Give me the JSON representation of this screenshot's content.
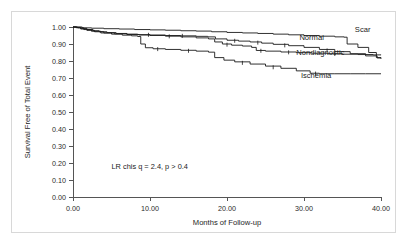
{
  "figure": {
    "background_color": "#ffffff",
    "frame_color": "#d8d8d8",
    "axis_color": "#555555",
    "curve_color": "#1a1a1a"
  },
  "annotation": {
    "statistics": "LR chis q = 2.4, p > 0.4"
  },
  "labels": {
    "scar": "Scar",
    "normal": "Normal",
    "nondiagnostic": "Nondiagnostic",
    "ischemia": "Ischemia"
  },
  "axes": {
    "x_title": "Months of Follow-up",
    "y_title": "Survival Free of Total Event",
    "x_ticks": [
      "0.00",
      "10.00",
      "20.00",
      "30.00",
      "40.00"
    ],
    "y_ticks": [
      "1.00",
      "0.90",
      "0.80",
      "0.70",
      "0.60",
      "0.50",
      "0.40",
      "0.30",
      "0.20",
      "0.10",
      "0.00"
    ]
  },
  "chart_data": {
    "type": "line",
    "title": "",
    "subtitle": "",
    "xlabel": "Months of Follow-up",
    "ylabel": "Survival Free of Total Event",
    "xlim": [
      0,
      40
    ],
    "ylim": [
      0,
      1
    ],
    "xticks": [
      0,
      10,
      20,
      30,
      40
    ],
    "yticks": [
      0.0,
      0.1,
      0.2,
      0.3,
      0.4,
      0.5,
      0.6,
      0.7,
      0.8,
      0.9,
      1.0
    ],
    "xtick_labels": [
      "0.00",
      "10.00",
      "20.00",
      "30.00",
      "40.00"
    ],
    "ytick_labels": [
      "0.00",
      "0.10",
      "0.20",
      "0.30",
      "0.40",
      "0.50",
      "0.60",
      "0.70",
      "0.80",
      "0.90",
      "1.00"
    ],
    "grid": false,
    "legend": "inline-right-labels",
    "annotations": [
      {
        "text": "LR chis q = 2.4, p > 0.4",
        "x": 5.0,
        "y": 0.165
      }
    ],
    "curve_style": "kaplan-meier step",
    "series": [
      {
        "name": "Scar",
        "label_x": 36.6,
        "label_y": 0.972,
        "points": [
          [
            0.0,
            1.0
          ],
          [
            0.6,
            1.0
          ],
          [
            1.2,
            0.995
          ],
          [
            2.4,
            0.993
          ],
          [
            4.0,
            0.99
          ],
          [
            6.0,
            0.988
          ],
          [
            8.0,
            0.985
          ],
          [
            10.0,
            0.983
          ],
          [
            12.0,
            0.981
          ],
          [
            14.0,
            0.978
          ],
          [
            16.0,
            0.976
          ],
          [
            18.0,
            0.972
          ],
          [
            20.0,
            0.968
          ],
          [
            22.0,
            0.965
          ],
          [
            24.0,
            0.962
          ],
          [
            26.0,
            0.958
          ],
          [
            28.0,
            0.954
          ],
          [
            30.0,
            0.95
          ],
          [
            32.0,
            0.946
          ],
          [
            34.0,
            0.942
          ],
          [
            35.2,
            0.94
          ],
          [
            35.6,
            0.9
          ],
          [
            37.0,
            0.88
          ],
          [
            38.4,
            0.85
          ],
          [
            39.4,
            0.82
          ],
          [
            40.0,
            0.815
          ]
        ]
      },
      {
        "name": "Normal",
        "label_x": 29.4,
        "label_y": 0.925,
        "points": [
          [
            0.0,
            1.0
          ],
          [
            0.5,
            0.998
          ],
          [
            1.0,
            0.992
          ],
          [
            1.8,
            0.985
          ],
          [
            2.6,
            0.978
          ],
          [
            3.4,
            0.972
          ],
          [
            4.4,
            0.967
          ],
          [
            5.6,
            0.962
          ],
          [
            7.0,
            0.958
          ],
          [
            8.4,
            0.955
          ],
          [
            10.0,
            0.953
          ],
          [
            12.0,
            0.95
          ],
          [
            14.0,
            0.948
          ],
          [
            16.0,
            0.945
          ],
          [
            17.5,
            0.942
          ],
          [
            18.5,
            0.93
          ],
          [
            20.0,
            0.922
          ],
          [
            21.5,
            0.917
          ],
          [
            23.0,
            0.912
          ],
          [
            24.5,
            0.905
          ],
          [
            26.0,
            0.898
          ],
          [
            28.0,
            0.89
          ],
          [
            30.0,
            0.88
          ],
          [
            32.0,
            0.868
          ],
          [
            34.0,
            0.855
          ],
          [
            36.0,
            0.843
          ],
          [
            38.0,
            0.83
          ],
          [
            39.5,
            0.818
          ],
          [
            40.0,
            0.815
          ]
        ],
        "censor_points": [
          [
            9.8,
            0.954
          ],
          [
            14.2,
            0.948
          ],
          [
            21.0,
            0.919
          ],
          [
            24.0,
            0.908
          ],
          [
            27.5,
            0.892
          ],
          [
            33.0,
            0.862
          ]
        ]
      },
      {
        "name": "Nondiagnostic",
        "label_x": 29.0,
        "label_y": 0.838,
        "points": [
          [
            0.0,
            1.0
          ],
          [
            0.4,
            0.996
          ],
          [
            1.0,
            0.988
          ],
          [
            1.8,
            0.98
          ],
          [
            2.8,
            0.972
          ],
          [
            4.0,
            0.965
          ],
          [
            5.4,
            0.96
          ],
          [
            7.0,
            0.956
          ],
          [
            8.6,
            0.953
          ],
          [
            10.0,
            0.95
          ],
          [
            12.0,
            0.946
          ],
          [
            14.0,
            0.942
          ],
          [
            16.0,
            0.936
          ],
          [
            17.6,
            0.93
          ],
          [
            18.4,
            0.912
          ],
          [
            19.4,
            0.9
          ],
          [
            20.6,
            0.893
          ],
          [
            22.0,
            0.888
          ],
          [
            23.2,
            0.88
          ],
          [
            23.8,
            0.862
          ],
          [
            25.0,
            0.858
          ],
          [
            27.0,
            0.853
          ],
          [
            29.0,
            0.849
          ],
          [
            31.0,
            0.846
          ],
          [
            33.0,
            0.843
          ],
          [
            35.0,
            0.84
          ],
          [
            37.0,
            0.838
          ],
          [
            39.0,
            0.836
          ],
          [
            40.0,
            0.835
          ]
        ],
        "censor_points": [
          [
            12.5,
            0.945
          ],
          [
            20.0,
            0.896
          ],
          [
            24.4,
            0.86
          ],
          [
            28.0,
            0.851
          ],
          [
            34.0,
            0.841
          ]
        ]
      },
      {
        "name": "Ischemia",
        "label_x": 29.6,
        "label_y": 0.7,
        "points": [
          [
            0.0,
            1.0
          ],
          [
            0.6,
            0.995
          ],
          [
            1.4,
            0.985
          ],
          [
            2.4,
            0.975
          ],
          [
            3.6,
            0.965
          ],
          [
            5.0,
            0.958
          ],
          [
            6.4,
            0.952
          ],
          [
            7.6,
            0.948
          ],
          [
            8.4,
            0.944
          ],
          [
            8.8,
            0.9
          ],
          [
            9.4,
            0.878
          ],
          [
            10.4,
            0.872
          ],
          [
            12.0,
            0.868
          ],
          [
            14.0,
            0.863
          ],
          [
            16.0,
            0.858
          ],
          [
            17.6,
            0.852
          ],
          [
            18.4,
            0.82
          ],
          [
            19.6,
            0.805
          ],
          [
            21.0,
            0.795
          ],
          [
            23.0,
            0.782
          ],
          [
            25.0,
            0.77
          ],
          [
            27.0,
            0.757
          ],
          [
            29.0,
            0.742
          ],
          [
            30.8,
            0.728
          ],
          [
            32.0,
            0.725
          ],
          [
            34.0,
            0.725
          ],
          [
            36.0,
            0.725
          ],
          [
            38.0,
            0.725
          ],
          [
            40.0,
            0.725
          ]
        ],
        "censor_points": [
          [
            11.0,
            0.87
          ],
          [
            15.0,
            0.86
          ],
          [
            22.0,
            0.789
          ],
          [
            26.0,
            0.763
          ],
          [
            31.5,
            0.726
          ]
        ]
      }
    ]
  }
}
